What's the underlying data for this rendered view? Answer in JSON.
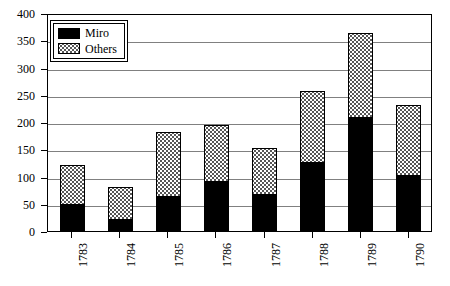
{
  "chart_data": {
    "type": "bar",
    "subtype": "stacked",
    "title": "",
    "xlabel": "",
    "ylabel": "",
    "categories": [
      "1783",
      "1784",
      "1785",
      "1786",
      "1787",
      "1788",
      "1789",
      "1790"
    ],
    "series": [
      {
        "name": "Miro",
        "values": [
          48,
          20,
          63,
          90,
          66,
          125,
          208,
          101
        ]
      },
      {
        "name": "Others",
        "values": [
          74,
          61,
          118,
          104,
          87,
          131,
          155,
          130
        ]
      }
    ],
    "totals": [
      122,
      81,
      181,
      194,
      153,
      256,
      363,
      231
    ],
    "ylim": [
      0,
      400
    ],
    "yticks": [
      0,
      50,
      100,
      150,
      200,
      250,
      300,
      350,
      400
    ],
    "ytick_labels": [
      "0",
      "50",
      "100",
      "150",
      "200",
      "250",
      "300",
      "350",
      "400"
    ],
    "grid": true,
    "grid_axis": "y",
    "legend_position": "upper left",
    "legend": [
      {
        "label": "Miro",
        "fill": "solid-black",
        "color": "#000000"
      },
      {
        "label": "Others",
        "fill": "dotted-stipple",
        "color": "#ffffff"
      }
    ],
    "xtick_rotation": -90
  }
}
